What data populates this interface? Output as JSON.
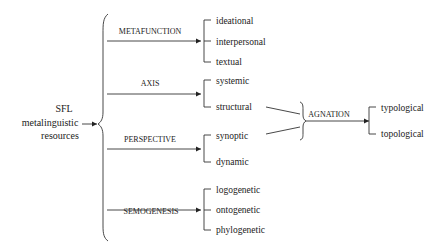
{
  "diagram": {
    "root": {
      "lines": [
        "SFL",
        "metalinguistic",
        "resources"
      ]
    },
    "dimensions": [
      {
        "label": "METAFUNCTION",
        "options": [
          "ideational",
          "interpersonal",
          "textual"
        ]
      },
      {
        "label": "AXIS",
        "options": [
          "systemic",
          "structural"
        ]
      },
      {
        "label": "PERSPECTIVE",
        "options": [
          "synoptic",
          "dynamic"
        ]
      },
      {
        "label": "SEMOGENESIS",
        "options": [
          "logogenetic",
          "ontogenetic",
          "phylogenetic"
        ]
      }
    ],
    "agnation": {
      "label": "AGNATION",
      "sources": [
        "structural",
        "synoptic"
      ],
      "options": [
        "typological",
        "topological"
      ]
    }
  }
}
